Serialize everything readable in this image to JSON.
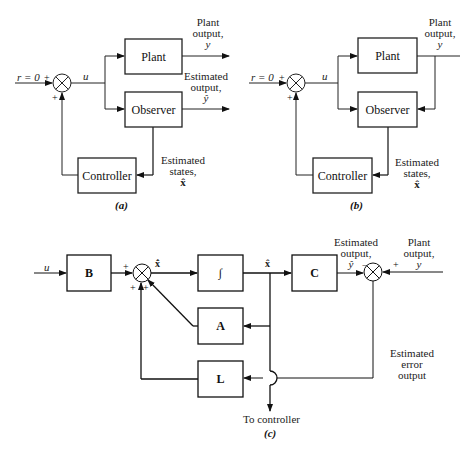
{
  "diagrams": {
    "a": {
      "caption": "(a)",
      "input_label": "r = 0",
      "signal_u": "u",
      "summer_signs": [
        "+",
        "+"
      ],
      "blocks": {
        "plant": "Plant",
        "observer": "Observer",
        "controller": "Controller"
      },
      "plant_output": [
        "Plant",
        "output,",
        "y"
      ],
      "estimated_output": [
        "Estimated",
        "output,",
        "ŷ"
      ],
      "estimated_states": [
        "Estimated",
        "states,",
        "x̂"
      ]
    },
    "b": {
      "caption": "(b)",
      "input_label": "r = 0",
      "signal_u": "u",
      "summer_signs": [
        "+",
        "+"
      ],
      "blocks": {
        "plant": "Plant",
        "observer": "Observer",
        "controller": "Controller"
      },
      "plant_output": [
        "Plant",
        "output,",
        "y"
      ],
      "estimated_states": [
        "Estimated",
        "states,",
        "x̂"
      ]
    },
    "c": {
      "caption": "(c)",
      "input_label": "u",
      "blocks": {
        "b": "B",
        "integrator": "∫",
        "c": "C",
        "a": "A",
        "l": "L"
      },
      "summer1_signs": [
        "+",
        "+",
        "+"
      ],
      "xhat_dot": "x̂̇",
      "xhat": "x̂",
      "estimated_output": [
        "Estimated",
        "output,",
        "ŷ"
      ],
      "summer2_signs": [
        "−",
        "+"
      ],
      "plant_output": [
        "Plant",
        "output,",
        "y"
      ],
      "error_output": [
        "Estimated",
        "error",
        "output"
      ],
      "to_controller": "To controller"
    }
  },
  "colors": {
    "line": "#111111",
    "thin_line": "#555555",
    "background": "#ffffff"
  }
}
